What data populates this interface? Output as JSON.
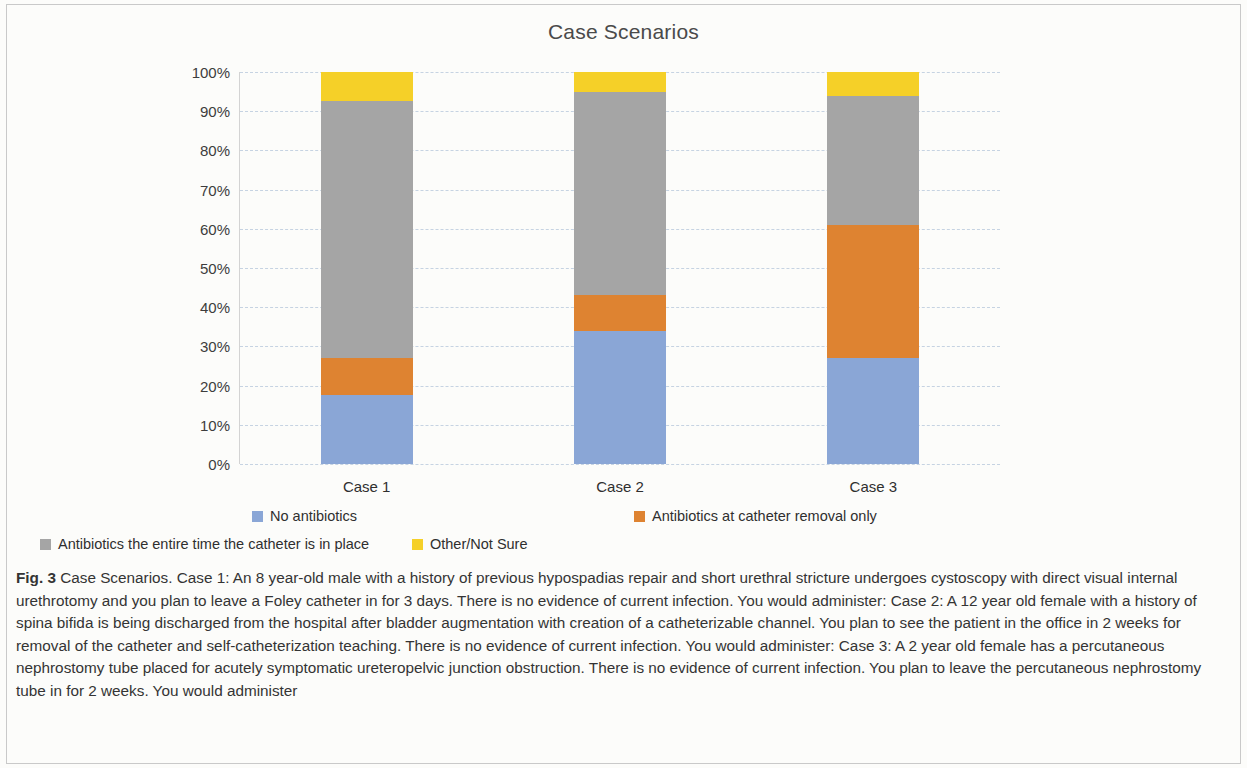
{
  "figure": {
    "caption_label": "Fig. 3",
    "caption_text": " Case Scenarios. Case 1: An 8 year-old male with a history of previous hypospadias repair and short urethral stricture undergoes cystoscopy with direct visual internal urethrotomy and you plan to leave a Foley catheter in for 3 days. There is no evidence of current infection. You would administer: Case 2: A 12 year old female with a history of spina bifida is being discharged from the hospital after bladder augmentation with creation of a catheterizable channel. You plan to see the patient in the office in 2 weeks for removal of the catheter and self-catheterization teaching. There is no evidence of current infection. You would administer: Case 3: A 2 year old female has a percutaneous nephrostomy tube placed for acutely symptomatic ureteropelvic junction obstruction. There is no evidence of current infection. You plan to leave the percutaneous nephrostomy tube in for 2 weeks. You would administer"
  },
  "chart_data": {
    "type": "bar",
    "stacked": true,
    "normalized_percent": true,
    "title": "Case Scenarios",
    "xlabel": "",
    "ylabel": "",
    "ylim": [
      0,
      100
    ],
    "ytick_values": [
      0,
      10,
      20,
      30,
      40,
      50,
      60,
      70,
      80,
      90,
      100
    ],
    "ytick_labels": [
      "0%",
      "10%",
      "20%",
      "30%",
      "40%",
      "50%",
      "60%",
      "70%",
      "80%",
      "90%",
      "100%"
    ],
    "grid": true,
    "grid_style": "dashed-horizontal",
    "legend_position": "bottom",
    "categories": [
      "Case 1",
      "Case 2",
      "Case 3"
    ],
    "series": [
      {
        "name": "No antibiotics",
        "color": "#8AA6D6",
        "values": [
          17.5,
          34.0,
          27.0
        ]
      },
      {
        "name": "Antibiotics at catheter removal only",
        "color": "#DE8331",
        "values": [
          9.5,
          9.0,
          34.0
        ]
      },
      {
        "name": "Antibiotics the entire time the catheter is in place",
        "color": "#A5A5A5",
        "values": [
          65.5,
          52.0,
          33.0
        ]
      },
      {
        "name": "Other/Not Sure",
        "color": "#F5D028",
        "values": [
          7.5,
          5.0,
          6.0
        ]
      }
    ]
  }
}
